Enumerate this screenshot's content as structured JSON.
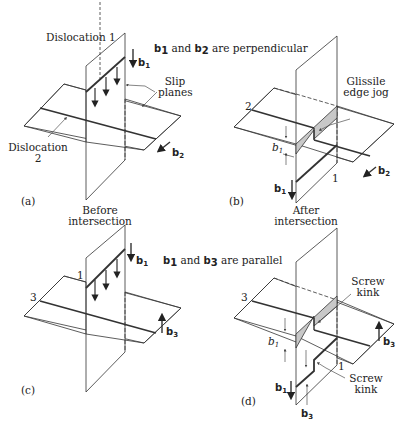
{
  "figure": {
    "panels": [
      {
        "id": "a",
        "label": "(a)",
        "labels": {
          "dislocation1": "Dislocation 1",
          "dislocation2_line1": "Dislocation",
          "dislocation2_line2": "2",
          "slip_planes_line1": "Slip",
          "slip_planes_line2": "planes",
          "b1": "b",
          "b1_sub": "1",
          "b2": "b",
          "b2_sub": "2"
        }
      },
      {
        "id": "b",
        "label": "(b)",
        "labels": {
          "line2": "2",
          "line1": "1",
          "jog_line1": "Glissile",
          "jog_line2": "edge jog",
          "b1_gap": "b",
          "b1_gap_sub": "1",
          "b1": "b",
          "b1_sub": "1",
          "b2": "b",
          "b2_sub": "2"
        }
      },
      {
        "id": "c",
        "label": "(c)",
        "labels": {
          "line1": "1",
          "line3": "3",
          "b1": "b",
          "b1_sub": "1",
          "b3": "b",
          "b3_sub": "3"
        }
      },
      {
        "id": "d",
        "label": "(d)",
        "labels": {
          "line3": "3",
          "line1": "1",
          "kink_top_line1": "Screw",
          "kink_top_line2": "kink",
          "kink_bottom_line1": "Screw",
          "kink_bottom_line2": "kink",
          "b1_gap": "b",
          "b1_gap_sub": "1",
          "b1": "b",
          "b1_sub": "1",
          "b3_right": "b",
          "b3_right_sub": "3",
          "b3_bottom": "b",
          "b3_bottom_sub": "3"
        }
      }
    ],
    "captions": {
      "perpendicular": {
        "pre": "b",
        "sub1": "1",
        "mid": " and ",
        "b": "b",
        "sub2": "2",
        "post": " are perpendicular"
      },
      "parallel": {
        "pre": "b",
        "sub1": "1",
        "mid": " and ",
        "b": "b",
        "sub2": "3",
        "post": " are parallel"
      },
      "before_line1": "Before",
      "before_line2": "intersection",
      "after_line1": "After",
      "after_line2": "intersection"
    },
    "colors": {
      "line": "#333333",
      "shade": "#c8c8c8"
    }
  }
}
